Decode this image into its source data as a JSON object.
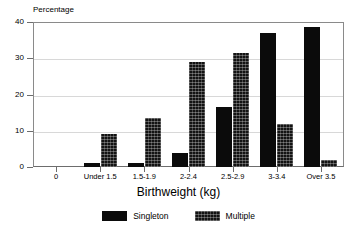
{
  "chart_data": {
    "type": "bar",
    "title": "",
    "xlabel": "Birthweight (kg)",
    "ylabel": "Percentage",
    "ylim": [
      0,
      40
    ],
    "yticks": [
      0,
      10,
      20,
      30,
      40
    ],
    "ytick_labels": [
      "0",
      "10",
      "20",
      "30",
      "40"
    ],
    "grid": true,
    "legend_position": "bottom",
    "categories": [
      "0",
      "Under 1.5",
      "1.5-1.9",
      "2-2.4",
      "2.5-2.9",
      "3-3.4",
      "Over 3.5"
    ],
    "series": [
      {
        "name": "Singleton",
        "color": "#0b0b0b",
        "fill": "solid",
        "values": [
          0,
          1.0,
          1.2,
          3.8,
          16.5,
          37.0,
          38.5
        ]
      },
      {
        "name": "Multiple",
        "color": "#131313",
        "fill": "hatched",
        "values": [
          0,
          9.0,
          13.5,
          29.0,
          31.5,
          12.0,
          2.0
        ]
      }
    ]
  },
  "legend": {
    "items": [
      {
        "label": "Singleton",
        "swatch": "solid-black-swatch"
      },
      {
        "label": "Multiple",
        "swatch": "hatched-black-swatch"
      }
    ]
  }
}
